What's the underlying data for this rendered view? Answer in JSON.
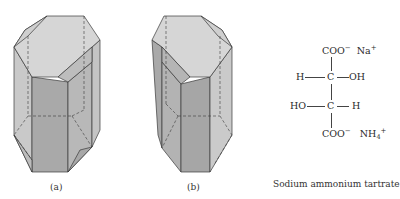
{
  "figure": {
    "panel_a": {
      "label": "(a)"
    },
    "panel_b": {
      "label": "(b)"
    },
    "structure": {
      "top_group": "COO",
      "top_charge": "−",
      "top_counterion": "Na",
      "top_counterion_charge": "+",
      "row1_left": "H",
      "row1_center": "C",
      "row1_right": "OH",
      "row2_left": "HO",
      "row2_center": "C",
      "row2_right": "H",
      "bottom_group": "COO",
      "bottom_charge": "−",
      "bottom_counterion": "NH",
      "bottom_counterion_sub": "4",
      "bottom_counterion_charge": "+"
    },
    "caption": "Sodium ammonium tartrate"
  }
}
